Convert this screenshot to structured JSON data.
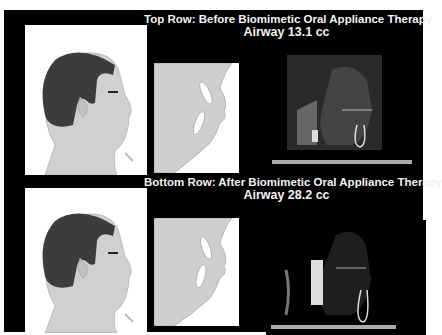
{
  "top_row": {
    "title": "Top Row: Before Biomimetic Oral Appliance Therapy",
    "airway": "Airway 13.1 cc",
    "panels": [
      "profile-illustration",
      "mouth-closeup-illustration",
      "ct-scan-airway"
    ]
  },
  "bottom_row": {
    "title": "Bottom Row: After Biomimetic Oral Appliance Therapy",
    "airway": "Airway 28.2 cc",
    "panels": [
      "profile-illustration",
      "mouth-closeup-illustration",
      "ct-scan-airway"
    ]
  },
  "colors": {
    "background": "#000000",
    "page": "#ffffff",
    "skin": "#cfcfcf",
    "hair": "#3a3a3a",
    "text": "#f2f2f2"
  }
}
